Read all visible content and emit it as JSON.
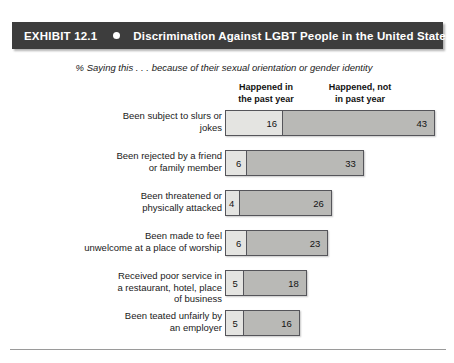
{
  "banner": {
    "exhibit_label": "EXHIBIT 12.1",
    "bullet_icon": "bullet-dot-icon",
    "title": "Discrimination Against LGBT People in the United States",
    "background_color": "#3d3d3d",
    "text_color": "#ffffff"
  },
  "subtitle": "% Saying this . . . because of their sexual orientation or gender identity",
  "columns": [
    {
      "line1": "Happened in",
      "line2": "the past year"
    },
    {
      "line1": "Happened, not",
      "line2": "in past year"
    }
  ],
  "chart_data": {
    "type": "bar",
    "title": "Discrimination Against LGBT People in the United States",
    "subtitle": "% Saying this . . . because of their sexual orientation or gender identity",
    "orientation": "horizontal",
    "stacked": true,
    "xlabel": "",
    "ylabel": "",
    "xlim": [
      0,
      59
    ],
    "grid": false,
    "legend_position": "top",
    "px_per_unit": 3.56,
    "categories": [
      "Been subject to slurs or jokes",
      "Been rejected by a friend or family member",
      "Been threatened or physically attacked",
      "Been made to feel unwelcome at a place of worship",
      "Received poor service in a restaurant, hotel, place of business",
      "Been teated unfairly by an employer"
    ],
    "series": [
      {
        "name": "Happened in the past year",
        "color": "#e4e4e1",
        "values": [
          16,
          6,
          4,
          6,
          5,
          5
        ]
      },
      {
        "name": "Happened, not in past year",
        "color": "#b9b9b6",
        "values": [
          43,
          33,
          26,
          23,
          18,
          16
        ]
      }
    ]
  },
  "rows": [
    {
      "label_line1": "Been subject to slurs or",
      "label_line2": "jokes",
      "past": 16,
      "not_past": 43
    },
    {
      "label_line1": "Been rejected by a friend",
      "label_line2": "or family member",
      "past": 6,
      "not_past": 33
    },
    {
      "label_line1": "Been threatened or",
      "label_line2": "physically attacked",
      "past": 4,
      "not_past": 26
    },
    {
      "label_line1": "Been made to feel",
      "label_line2": "unwelcome at a place of worship",
      "past": 6,
      "not_past": 23
    },
    {
      "label_line1": "Received poor service in",
      "label_line2": "a restaurant, hotel, place",
      "label_line3": "of business",
      "past": 5,
      "not_past": 18
    },
    {
      "label_line1": "Been teated unfairly by",
      "label_line2": "an employer",
      "past": 5,
      "not_past": 16
    }
  ]
}
